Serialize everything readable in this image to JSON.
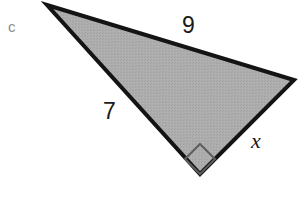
{
  "figure": {
    "part_label": "c",
    "canvas": {
      "width": 301,
      "height": 218,
      "background": "#ffffff"
    },
    "shape": {
      "type": "right-triangle",
      "fill_color": "#ababab",
      "stroke_color": "#141414",
      "stroke_width": 4,
      "vertices": [
        {
          "name": "apex-left",
          "x": 47,
          "y": 5
        },
        {
          "name": "vertex-right",
          "x": 294,
          "y": 80
        },
        {
          "name": "vertex-bottom-right-angle",
          "x": 200,
          "y": 174
        }
      ]
    },
    "right_angle_marker": {
      "at_vertex": "vertex-bottom-right-angle",
      "stroke_color": "#5e5e5e",
      "stroke_width": 2,
      "points": "200,144 215,159 200,174 185,159"
    },
    "labels": [
      {
        "name": "side-top",
        "text": "9",
        "side": "apex-left to vertex-right",
        "x": 182,
        "y": 14,
        "style": "sans"
      },
      {
        "name": "side-left",
        "text": "7",
        "side": "apex-left to vertex-bottom",
        "x": 103,
        "y": 100,
        "style": "sans"
      },
      {
        "name": "side-unknown",
        "text": "x",
        "side": "vertex-bottom to vertex-right",
        "x": 251,
        "y": 130,
        "style": "italic-serif"
      }
    ]
  }
}
